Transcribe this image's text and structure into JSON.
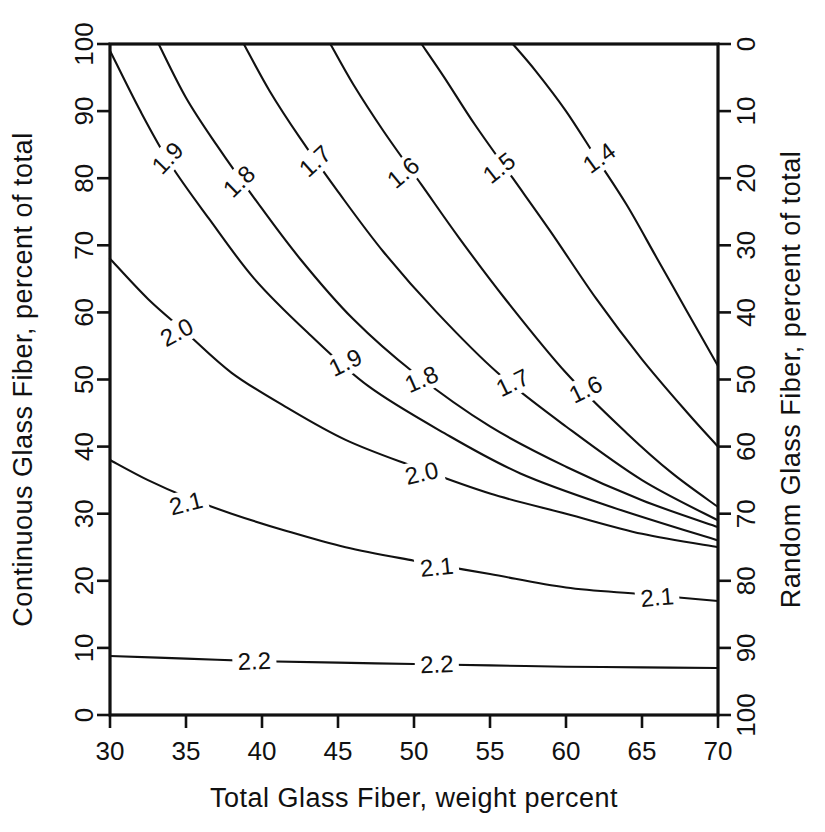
{
  "chart_data": {
    "type": "line",
    "subtype": "contour",
    "title": "",
    "xlabel": "Total Glass Fiber, weight percent",
    "ylabel": "Continuous Glass Fiber, percent of total",
    "y2label": "Random Glass Fiber, percent of total",
    "xlim": [
      30,
      70
    ],
    "ylim": [
      0,
      100
    ],
    "y2lim": [
      100,
      0
    ],
    "grid": false,
    "legend": "none",
    "xticks": [
      30,
      35,
      40,
      45,
      50,
      55,
      60,
      65,
      70
    ],
    "xtick_labels": [
      "30",
      "35",
      "40",
      "45",
      "50",
      "55",
      "60",
      "65",
      "70"
    ],
    "yticks": [
      0,
      10,
      20,
      30,
      40,
      50,
      60,
      70,
      80,
      90,
      100
    ],
    "ytick_labels": [
      "0",
      "10",
      "20",
      "30",
      "40",
      "50",
      "60",
      "70",
      "80",
      "90",
      "100"
    ],
    "y2ticks": [
      0,
      10,
      20,
      30,
      40,
      50,
      60,
      70,
      80,
      90,
      100
    ],
    "y2tick_labels": [
      "0",
      "10",
      "20",
      "30",
      "40",
      "50",
      "60",
      "70",
      "80",
      "90",
      "100"
    ],
    "line_color": "#111111",
    "contour_levels": [
      1.4,
      1.5,
      1.6,
      1.7,
      1.8,
      1.9,
      2.0,
      2.1,
      2.2
    ],
    "contours": [
      {
        "level": 1.4,
        "label": "1.4",
        "points": [
          [
            56.5,
            100
          ],
          [
            58,
            96
          ],
          [
            60,
            90
          ],
          [
            62,
            83
          ],
          [
            64,
            76
          ],
          [
            66,
            68
          ],
          [
            68,
            60
          ],
          [
            70,
            52
          ]
        ],
        "labels": [
          {
            "text": "1.4",
            "x": 62.2,
            "y": 83.0,
            "rot": -36
          },
          {
            "text": "1.4",
            "x": 0,
            "y": 0,
            "rot": 0,
            "hidden": true
          }
        ]
      },
      {
        "level": 1.5,
        "label": "1.5",
        "points": [
          [
            50.5,
            100
          ],
          [
            52,
            95
          ],
          [
            54,
            88
          ],
          [
            56.5,
            80
          ],
          [
            59,
            72
          ],
          [
            62,
            62
          ],
          [
            65,
            53
          ],
          [
            68,
            45
          ],
          [
            70,
            40
          ]
        ],
        "labels": [
          {
            "text": "1.5",
            "x": 55.6,
            "y": 81.5,
            "rot": -38
          }
        ]
      },
      {
        "level": 1.6,
        "label": "1.6",
        "points": [
          [
            44.5,
            100
          ],
          [
            46,
            94
          ],
          [
            48,
            87
          ],
          [
            50.5,
            79
          ],
          [
            53,
            71
          ],
          [
            56,
            62
          ],
          [
            60,
            51
          ],
          [
            64,
            42
          ],
          [
            67,
            36
          ],
          [
            70,
            31
          ]
        ],
        "labels": [
          {
            "text": "1.6",
            "x": 49.3,
            "y": 80.8,
            "rot": -40
          },
          {
            "text": "1.6",
            "x": 61.3,
            "y": 48.5,
            "rot": -26
          }
        ]
      },
      {
        "level": 1.7,
        "label": "1.7",
        "points": [
          [
            38.8,
            100
          ],
          [
            40.5,
            93
          ],
          [
            42.5,
            86
          ],
          [
            45,
            78
          ],
          [
            48,
            69
          ],
          [
            51.5,
            60
          ],
          [
            55.5,
            51
          ],
          [
            60,
            43
          ],
          [
            65,
            35
          ],
          [
            70,
            29
          ]
        ],
        "labels": [
          {
            "text": "1.7",
            "x": 43.5,
            "y": 82.5,
            "rot": -42
          },
          {
            "text": "1.7",
            "x": 56.5,
            "y": 49.5,
            "rot": -26
          }
        ]
      },
      {
        "level": 1.8,
        "label": "1.8",
        "points": [
          [
            33.2,
            100
          ],
          [
            35,
            92
          ],
          [
            37,
            85
          ],
          [
            39.5,
            77
          ],
          [
            42.5,
            68
          ],
          [
            46,
            59
          ],
          [
            50,
            51
          ],
          [
            55,
            43
          ],
          [
            60,
            37
          ],
          [
            65,
            32
          ],
          [
            70,
            28
          ]
        ],
        "labels": [
          {
            "text": "1.8",
            "x": 38.5,
            "y": 79.5,
            "rot": -44
          },
          {
            "text": "1.8",
            "x": 50.5,
            "y": 50.0,
            "rot": -24
          }
        ]
      },
      {
        "level": 1.9,
        "label": "1.9",
        "points": [
          [
            30,
            99
          ],
          [
            32,
            90
          ],
          [
            34,
            82
          ],
          [
            36.5,
            74
          ],
          [
            39.5,
            65
          ],
          [
            43,
            57
          ],
          [
            47,
            49
          ],
          [
            52,
            42
          ],
          [
            57,
            36
          ],
          [
            63,
            31
          ],
          [
            70,
            26
          ]
        ],
        "labels": [
          {
            "text": "1.9",
            "x": 33.8,
            "y": 83.0,
            "rot": -46
          },
          {
            "text": "1.9",
            "x": 45.5,
            "y": 52.5,
            "rot": -26
          }
        ]
      },
      {
        "level": 2.0,
        "label": "2.0",
        "points": [
          [
            30,
            68
          ],
          [
            32.5,
            62
          ],
          [
            35,
            57
          ],
          [
            38,
            51
          ],
          [
            41.5,
            46
          ],
          [
            45.5,
            41
          ],
          [
            50,
            37
          ],
          [
            55,
            33
          ],
          [
            60,
            30
          ],
          [
            65,
            27
          ],
          [
            70,
            25
          ]
        ],
        "labels": [
          {
            "text": "2.0",
            "x": 34.4,
            "y": 57.0,
            "rot": -28
          },
          {
            "text": "2.0",
            "x": 50.5,
            "y": 36.0,
            "rot": -13
          }
        ]
      },
      {
        "level": 2.1,
        "label": "2.1",
        "points": [
          [
            30,
            38
          ],
          [
            32.5,
            35
          ],
          [
            35,
            32.5
          ],
          [
            38,
            30
          ],
          [
            41.5,
            27.5
          ],
          [
            45.5,
            25
          ],
          [
            50,
            23
          ],
          [
            55,
            21
          ],
          [
            60,
            19
          ],
          [
            65,
            18
          ],
          [
            70,
            17
          ]
        ],
        "labels": [
          {
            "text": "2.1",
            "x": 35.0,
            "y": 31.5,
            "rot": -14
          },
          {
            "text": "2.1",
            "x": 51.5,
            "y": 22.0,
            "rot": -6
          },
          {
            "text": "2.1",
            "x": 66.0,
            "y": 17.5,
            "rot": -5
          }
        ]
      },
      {
        "level": 2.2,
        "label": "2.2",
        "points": [
          [
            30,
            8.8
          ],
          [
            35,
            8.4
          ],
          [
            40,
            8.0
          ],
          [
            45,
            7.8
          ],
          [
            50,
            7.6
          ],
          [
            55,
            7.4
          ],
          [
            60,
            7.2
          ],
          [
            65,
            7.1
          ],
          [
            70,
            7.0
          ]
        ],
        "labels": [
          {
            "text": "2.2",
            "x": 39.5,
            "y": 8.0,
            "rot": -2
          },
          {
            "text": "2.2",
            "x": 51.5,
            "y": 7.5,
            "rot": -2
          }
        ]
      }
    ]
  }
}
